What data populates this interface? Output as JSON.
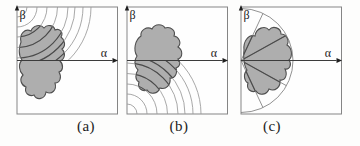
{
  "figure": {
    "canvas": {
      "width": 360,
      "height": 146,
      "background": "#fdfdfc"
    },
    "style": {
      "box_border": "#858585",
      "box_fill": "#fefefe",
      "axis_color": "#3c3c3c",
      "arrow_color": "#1f1f1f",
      "arc_color": "#989898",
      "ray_color": "#7e7e7e",
      "dark_line_color": "#4a4a4a",
      "blob_fill": "#aeaeae",
      "blob_outline": "#4f4f4f",
      "label_color": "#222222",
      "caption_color": "#1b1b1b"
    },
    "geometry": {
      "box": {
        "x": 2,
        "y": 3,
        "w": 100.5,
        "h": 107
      },
      "axis_y": 56.5,
      "axis_arrow_tip_x": 103,
      "arc_radii": [
        10,
        20,
        30,
        40.5,
        51,
        58,
        66,
        74
      ],
      "semicircle_radius": 52,
      "ray_angles_deg": [
        65,
        29,
        -29,
        -65
      ]
    },
    "panels": [
      {
        "id": "a",
        "caption": "(a)",
        "alpha_label": "α",
        "beta_label": "β",
        "pattern": "arcs-top-left",
        "left": 14,
        "caption_center_x": 86,
        "blob_path": "M 6,38 C 4,30 10,24 16,27 C 18,21 26,20 29,24 C 32,20 39,21 40,26 C 44,24 49,28 46,33 C 50,36 51,42 47,45 C 51,49 50,55 45,57 C 49,61 48,67 44,68 C 47,73 45,79 40,79 C 42,86 37,91 31,88 C 30,95 22,97 19,91 C 14,93 9,89 11,83 C 6,81 4,75 8,71 C 4,67 3,60 7,56 C 3,51 4,43 6,38 Z"
      },
      {
        "id": "b",
        "caption": "(b)",
        "alpha_label": "α",
        "beta_label": "β",
        "pattern": "arcs-bottom-left",
        "left": 124,
        "caption_center_x": 179,
        "blob_path": "M 12,52 C 8,46 10,36 16,32 C 15,26 22,22 27,25 C 30,19 38,20 40,24 C 46,22 51,27 49,32 C 54,33 57,39 53,43 C 58,46 58,53 53,55 C 56,58 55,63 51,64 C 53,70 49,75 45,74 C 46,81 41,86 35,84 C 33,90 25,91 22,86 C 17,88 12,84 14,78 C 10,76 10,70 13,66 C 9,62 9,56 12,52 Z"
      },
      {
        "id": "c",
        "caption": "(c)",
        "alpha_label": "α",
        "beta_label": "β",
        "pattern": "rays-left",
        "left": 238,
        "caption_center_x": 272,
        "blob_path": "M 5,46 C 4,38 9,30 16,32 C 17,24 26,21 30,26 C 34,21 42,24 42,30 C 47,30 51,36 48,41 C 53,44 54,52 50,56 C 53,60 51,66 46,65 C 49,71 46,77 41,76 C 42,83 36,88 30,85 C 28,91 20,92 17,87 C 12,89 7,85 9,79 C 5,77 4,70 8,66 C 5,62 4,52 5,46 Z"
      }
    ]
  }
}
